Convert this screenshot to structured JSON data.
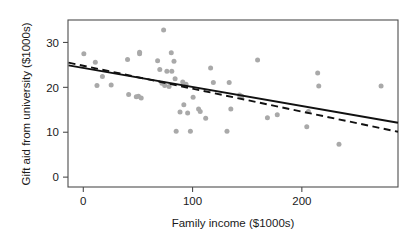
{
  "chart_data": {
    "type": "scatter",
    "title": "",
    "xlabel": "Family income ($1000s)",
    "ylabel": "Gift aid from university ($1000s)",
    "xlim": [
      -14,
      288
    ],
    "ylim": [
      -2.2,
      35.0
    ],
    "xticks": [
      0,
      100,
      200
    ],
    "xtick_labels": [
      "0",
      "100",
      "200"
    ],
    "yticks": [
      0,
      10,
      20,
      30
    ],
    "ytick_labels": [
      "0",
      "10",
      "20",
      "30"
    ],
    "grid": false,
    "legend": null,
    "point_color": "#a9a9a9",
    "point_size": 5,
    "line_color": "#111111",
    "axis_color": "#4d4d4d",
    "x": [
      0.5,
      11.0,
      12.5,
      17.5,
      25.5,
      40.5,
      41.5,
      48.5,
      50.5,
      51.5,
      51.5,
      53.0,
      68.0,
      70.0,
      72.0,
      73.5,
      74.5,
      76.5,
      78.5,
      80.5,
      81.0,
      83.0,
      84.0,
      85.0,
      88.5,
      91.0,
      92.0,
      94.0,
      95.5,
      98.0,
      100.5,
      105.5,
      107.0,
      112.0,
      116.5,
      119.0,
      131.5,
      133.5,
      135.0,
      143.0,
      145.0,
      159.5,
      168.5,
      177.5,
      204.5,
      206.0,
      214.5,
      215.5,
      234.0,
      272.5
    ],
    "y": [
      27.5,
      25.6,
      20.4,
      22.4,
      20.5,
      26.2,
      18.4,
      17.9,
      18.0,
      27.5,
      27.8,
      17.6,
      25.9,
      24.0,
      20.9,
      32.8,
      20.4,
      23.6,
      20.2,
      27.7,
      23.6,
      25.8,
      21.9,
      10.2,
      14.5,
      21.2,
      16.1,
      20.7,
      14.3,
      10.2,
      17.8,
      15.2,
      14.6,
      13.1,
      24.3,
      21.1,
      10.2,
      21.1,
      15.2,
      18.3,
      18.0,
      26.1,
      13.2,
      13.9,
      11.2,
      14.6,
      23.2,
      20.3,
      7.3,
      20.3
    ],
    "fits": [
      {
        "name": "least-squares-line",
        "style": "solid",
        "x0": -13.5,
        "y0": 24.9,
        "x1": 288.0,
        "y1": 12.1
      },
      {
        "name": "robust-line",
        "style": "dashed",
        "x0": -13.5,
        "y0": 25.5,
        "x1": 288.0,
        "y1": 10.1
      }
    ]
  }
}
